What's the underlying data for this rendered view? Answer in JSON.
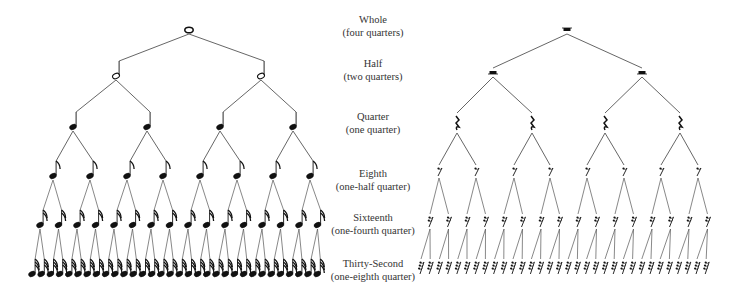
{
  "levels": [
    {
      "name": "Whole",
      "sub": "(four quarters)",
      "label_y": 18,
      "note_y": 30,
      "rest_y": 30,
      "count": 1
    },
    {
      "name": "Half",
      "sub": "(two quarters)",
      "label_y": 62,
      "note_y": 76,
      "rest_y": 73,
      "count": 2
    },
    {
      "name": "Quarter",
      "sub": "(one quarter)",
      "label_y": 112,
      "note_y": 127,
      "rest_y": 124,
      "count": 4
    },
    {
      "name": "Eighth",
      "sub": "(one-half quarter)",
      "label_y": 168,
      "note_y": 176,
      "rest_y": 172,
      "count": 8
    },
    {
      "name": "Sixteenth",
      "sub": "(one-fourth quarter)",
      "label_y": 213,
      "note_y": 225,
      "rest_y": 222,
      "count": 16
    },
    {
      "name": "Thirty-Second",
      "sub": "(one-eighth quarter)",
      "label_y": 258,
      "note_y": 274,
      "rest_y": 268,
      "count": 32
    }
  ],
  "notes_tree": {
    "symbol_names": [
      "whole-note",
      "half-note",
      "quarter-note",
      "eighth-note",
      "sixteenth-note",
      "thirty-second-note"
    ],
    "x_positions": [
      [
        189
      ],
      [
        116,
        261
      ],
      [
        73,
        147,
        220,
        293
      ],
      [
        53,
        90,
        127,
        163,
        200,
        237,
        273,
        310
      ],
      [
        40,
        58.5,
        77,
        95.5,
        114,
        132.5,
        151,
        169.5,
        188,
        206.5,
        225,
        243.5,
        262,
        280.5,
        299,
        317.5
      ],
      [
        32,
        41.2,
        50.4,
        59.6,
        68.8,
        78,
        87.2,
        96.4,
        105.6,
        114.8,
        124,
        133.2,
        142.4,
        151.6,
        160.8,
        170,
        179.2,
        188.4,
        197.6,
        206.8,
        216,
        225.2,
        234.4,
        243.6,
        252.8,
        262,
        271.2,
        280.4,
        289.6,
        298.8,
        308,
        317.2
      ]
    ]
  },
  "rests_tree": {
    "symbol_names": [
      "whole-rest",
      "half-rest",
      "quarter-rest",
      "eighth-rest",
      "sixteenth-rest",
      "thirty-second-rest"
    ],
    "x_positions": [
      [
        567
      ],
      [
        493,
        642
      ],
      [
        457,
        532,
        605,
        680
      ],
      [
        439,
        476,
        514,
        550,
        587,
        624,
        661,
        698
      ],
      [
        430,
        448.5,
        467,
        485.5,
        504,
        522.5,
        541,
        559.5,
        578,
        596.5,
        615,
        633.5,
        652,
        670.5,
        689,
        707.5
      ],
      [
        421,
        430.2,
        439.4,
        448.6,
        457.8,
        467,
        476.2,
        485.4,
        494.6,
        503.8,
        513,
        522.2,
        531.4,
        540.6,
        549.8,
        559,
        568.2,
        577.4,
        586.6,
        595.8,
        605,
        614.2,
        623.4,
        632.6,
        641.8,
        651,
        660.2,
        669.4,
        678.6,
        687.8,
        697,
        706.2
      ]
    ]
  },
  "colors": {
    "ink": "#111111",
    "line": "#555555",
    "text": "#333333",
    "background": "#ffffff"
  }
}
